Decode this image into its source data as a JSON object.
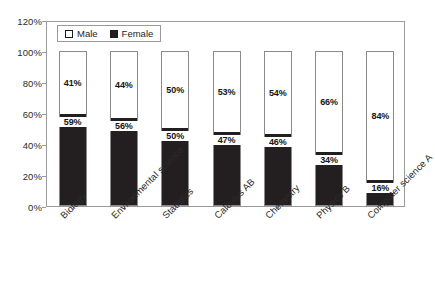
{
  "chart_data": {
    "type": "bar",
    "subtype": "100% stacked bar",
    "title": "",
    "subtitle": "",
    "xlabel": "",
    "ylabel": "",
    "ylim": [
      0,
      120
    ],
    "ytick_step": 20,
    "ytick_labels": [
      "0%",
      "20%",
      "40%",
      "60%",
      "80%",
      "100%",
      "120%"
    ],
    "ytick_values": [
      0,
      20,
      40,
      60,
      80,
      100,
      120
    ],
    "grid": false,
    "legend_position": "top-left inside plot",
    "categories": [
      "Biology",
      "Environmental science",
      "Statistics",
      "Calculus AB",
      "Chemistry",
      "Physics B",
      "Computer science A"
    ],
    "series": [
      {
        "name": "Male",
        "color": "#ffffff",
        "values": [
          41,
          44,
          50,
          53,
          54,
          66,
          84
        ],
        "labels": [
          "41%",
          "44%",
          "50%",
          "53%",
          "54%",
          "66%",
          "84%"
        ]
      },
      {
        "name": "Female",
        "color": "#231f20",
        "values": [
          59,
          56,
          50,
          47,
          46,
          34,
          16
        ],
        "labels": [
          "59%",
          "56%",
          "50%",
          "47%",
          "46%",
          "34%",
          "16%"
        ]
      }
    ]
  },
  "legend": {
    "items": [
      {
        "label": "Male",
        "swatch": "open-square-icon"
      },
      {
        "label": "Female",
        "swatch": "filled-square-icon"
      }
    ]
  },
  "axis": {
    "y_labels": [
      "120%",
      "100%",
      "80%",
      "60%",
      "40%",
      "20%",
      "0%"
    ]
  }
}
